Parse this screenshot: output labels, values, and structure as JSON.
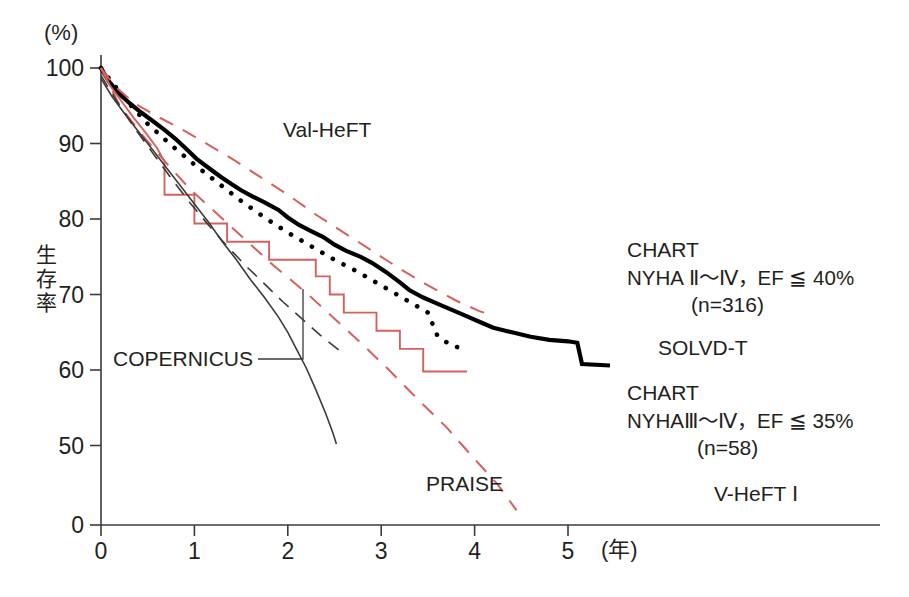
{
  "chart_data": {
    "type": "line",
    "title": "",
    "xlabel": "(年)",
    "ylabel": "生存率",
    "yunit": "(%)",
    "xlim": [
      0,
      5.6
    ],
    "ylim": [
      45,
      100
    ],
    "y_axis_break": true,
    "grid": false,
    "legend": "inline-annotations",
    "xticks": [
      "0",
      "1",
      "2",
      "3",
      "4",
      "5"
    ],
    "yticks": [
      "100",
      "90",
      "80",
      "70",
      "60",
      "50",
      "0"
    ],
    "series": [
      {
        "name": "CHART NYHA II-IV",
        "label": "CHART",
        "style": "thick-solid-black",
        "color": "#000000",
        "points": [
          [
            0.0,
            100.0
          ],
          [
            0.08,
            98.3
          ],
          [
            0.18,
            96.8
          ],
          [
            0.3,
            95.4
          ],
          [
            0.42,
            94.2
          ],
          [
            0.55,
            93.0
          ],
          [
            0.68,
            91.8
          ],
          [
            0.8,
            90.6
          ],
          [
            0.92,
            89.2
          ],
          [
            1.02,
            88.0
          ],
          [
            1.15,
            86.8
          ],
          [
            1.28,
            85.6
          ],
          [
            1.4,
            84.6
          ],
          [
            1.5,
            83.8
          ],
          [
            1.62,
            83.0
          ],
          [
            1.75,
            82.2
          ],
          [
            1.9,
            81.2
          ],
          [
            2.0,
            80.2
          ],
          [
            2.12,
            79.2
          ],
          [
            2.25,
            78.4
          ],
          [
            2.38,
            77.6
          ],
          [
            2.5,
            76.6
          ],
          [
            2.62,
            75.8
          ],
          [
            2.78,
            75.0
          ],
          [
            2.9,
            74.2
          ],
          [
            3.05,
            73.0
          ],
          [
            3.2,
            71.6
          ],
          [
            3.3,
            70.6
          ],
          [
            3.45,
            69.6
          ],
          [
            3.6,
            68.8
          ],
          [
            3.75,
            68.0
          ],
          [
            3.9,
            67.2
          ],
          [
            4.05,
            66.4
          ],
          [
            4.2,
            65.6
          ],
          [
            4.4,
            65.0
          ],
          [
            4.6,
            64.4
          ],
          [
            4.8,
            64.0
          ],
          [
            5.0,
            63.8
          ],
          [
            5.1,
            63.6
          ],
          [
            5.15,
            60.8
          ],
          [
            5.45,
            60.6
          ]
        ]
      },
      {
        "name": "SOLVD-T",
        "label": "SOLVD-T",
        "style": "dotted-black",
        "color": "#000000",
        "points": [
          [
            0.0,
            100.0
          ],
          [
            0.25,
            96.0
          ],
          [
            0.5,
            92.6
          ],
          [
            0.75,
            89.8
          ],
          [
            1.0,
            87.2
          ],
          [
            1.25,
            84.8
          ],
          [
            1.5,
            82.4
          ],
          [
            1.75,
            80.2
          ],
          [
            2.0,
            78.2
          ],
          [
            2.25,
            76.4
          ],
          [
            2.5,
            74.6
          ],
          [
            2.75,
            73.0
          ],
          [
            3.0,
            71.2
          ],
          [
            3.25,
            69.4
          ],
          [
            3.5,
            67.6
          ],
          [
            3.6,
            64.6
          ],
          [
            3.75,
            63.2
          ],
          [
            3.9,
            62.8
          ]
        ]
      },
      {
        "name": "CHART NYHA III-IV",
        "label": "CHART",
        "style": "step-solid-red",
        "color": "#d4615c",
        "points": [
          [
            0.0,
            100.0
          ],
          [
            0.1,
            97.6
          ],
          [
            0.22,
            95.6
          ],
          [
            0.35,
            93.4
          ],
          [
            0.48,
            91.4
          ],
          [
            0.6,
            89.4
          ],
          [
            0.68,
            87.6
          ],
          [
            0.68,
            83.2
          ],
          [
            1.0,
            83.2
          ],
          [
            1.0,
            79.4
          ],
          [
            1.35,
            79.4
          ],
          [
            1.35,
            77.0
          ],
          [
            1.8,
            77.0
          ],
          [
            1.8,
            74.6
          ],
          [
            2.3,
            74.6
          ],
          [
            2.3,
            72.4
          ],
          [
            2.45,
            72.4
          ],
          [
            2.45,
            70.0
          ],
          [
            2.6,
            70.0
          ],
          [
            2.6,
            67.6
          ],
          [
            2.95,
            67.6
          ],
          [
            2.95,
            65.2
          ],
          [
            3.2,
            65.2
          ],
          [
            3.2,
            62.8
          ],
          [
            3.45,
            62.8
          ],
          [
            3.45,
            59.8
          ],
          [
            3.92,
            59.8
          ]
        ]
      },
      {
        "name": "Val-HeFT",
        "label": "Val-HeFT",
        "style": "dashed-red",
        "color": "#d4615c",
        "points": [
          [
            0.0,
            100.0
          ],
          [
            0.15,
            97.6
          ],
          [
            0.35,
            95.4
          ],
          [
            0.6,
            93.6
          ],
          [
            0.85,
            92.0
          ],
          [
            1.1,
            90.2
          ],
          [
            1.4,
            88.0
          ],
          [
            1.7,
            85.6
          ],
          [
            2.0,
            83.2
          ],
          [
            2.3,
            80.6
          ],
          [
            2.6,
            78.2
          ],
          [
            2.9,
            75.8
          ],
          [
            3.2,
            73.4
          ],
          [
            3.5,
            71.2
          ],
          [
            3.8,
            69.2
          ],
          [
            4.05,
            67.8
          ],
          [
            4.2,
            67.2
          ]
        ]
      },
      {
        "name": "V-HeFT I",
        "label": "V-HeFT I",
        "style": "dashed-red",
        "color": "#d4615c",
        "points": [
          [
            0.0,
            100.0
          ],
          [
            0.2,
            95.0
          ],
          [
            0.45,
            91.0
          ],
          [
            0.7,
            87.4
          ],
          [
            0.95,
            84.0
          ],
          [
            1.25,
            80.6
          ],
          [
            1.55,
            77.2
          ],
          [
            1.85,
            73.8
          ],
          [
            2.2,
            70.2
          ],
          [
            2.5,
            66.8
          ],
          [
            2.8,
            63.4
          ],
          [
            3.1,
            59.8
          ],
          [
            3.4,
            56.0
          ],
          [
            3.7,
            52.4
          ],
          [
            4.0,
            48.2
          ],
          [
            4.25,
            44.8
          ],
          [
            4.45,
            41.4
          ]
        ]
      },
      {
        "name": "COPERNICUS",
        "label": "COPERNICUS",
        "style": "dashed-thin-black",
        "color": "#3b3b3b",
        "points": [
          [
            0.0,
            99.0
          ],
          [
            0.15,
            96.0
          ],
          [
            0.35,
            92.2
          ],
          [
            0.55,
            88.8
          ],
          [
            0.75,
            85.4
          ],
          [
            0.95,
            82.2
          ],
          [
            1.15,
            79.2
          ],
          [
            1.35,
            76.4
          ],
          [
            1.55,
            73.8
          ],
          [
            1.75,
            71.4
          ],
          [
            1.95,
            69.0
          ],
          [
            2.15,
            66.8
          ],
          [
            2.35,
            64.6
          ],
          [
            2.55,
            62.6
          ]
        ]
      },
      {
        "name": "PRAISE",
        "label": "PRAISE",
        "style": "thin-solid-black",
        "color": "#3b3b3b",
        "points": [
          [
            0.0,
            98.6
          ],
          [
            0.12,
            96.2
          ],
          [
            0.25,
            94.0
          ],
          [
            0.4,
            91.6
          ],
          [
            0.55,
            89.2
          ],
          [
            0.7,
            86.8
          ],
          [
            0.85,
            84.4
          ],
          [
            1.0,
            82.0
          ],
          [
            1.15,
            79.6
          ],
          [
            1.3,
            77.0
          ],
          [
            1.45,
            74.6
          ],
          [
            1.6,
            72.0
          ],
          [
            1.75,
            69.6
          ],
          [
            1.9,
            67.0
          ],
          [
            2.0,
            65.0
          ],
          [
            2.1,
            62.6
          ],
          [
            2.2,
            60.2
          ],
          [
            2.3,
            57.4
          ],
          [
            2.4,
            54.4
          ],
          [
            2.48,
            51.8
          ],
          [
            2.52,
            50.2
          ]
        ]
      }
    ]
  },
  "annotations": {
    "val_heft": "Val-HeFT",
    "copernicus": "COPERNICUS",
    "praise": "PRAISE",
    "solvd_t": "SOLVD-T",
    "v_heft_1": "V-HeFT Ⅰ",
    "chart_upper_line1": "CHART",
    "chart_upper_line2": "NYHA Ⅱ〜Ⅳ，EF ≦ 40%",
    "chart_upper_line3": "(n=316)",
    "chart_lower_line1": "CHART",
    "chart_lower_line2": "NYHAⅢ〜Ⅳ，EF ≦ 35%",
    "chart_lower_line3": "(n=58)"
  },
  "axes": {
    "y_unit": "(%)",
    "y_title": "生存率",
    "x_unit": "(年)",
    "y_ticks": [
      "100",
      "90",
      "80",
      "70",
      "60",
      "50",
      "0"
    ],
    "x_ticks": [
      "0",
      "1",
      "2",
      "3",
      "4",
      "5"
    ]
  },
  "colors": {
    "red": "#d4615c",
    "black": "#000000",
    "gray": "#3b3b3b"
  }
}
